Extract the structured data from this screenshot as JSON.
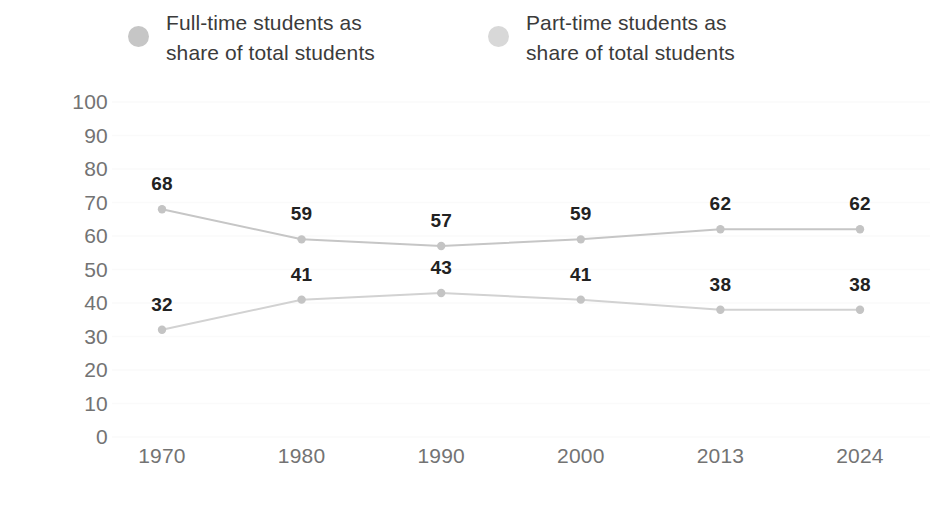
{
  "legend": {
    "items": [
      {
        "label": "Full-time students as\nshare of total students",
        "color": "#c6c6c6",
        "marker": "legend-dot-full-time"
      },
      {
        "label": "Part-time students as\nshare of total students",
        "color": "#d8d8d8",
        "marker": "legend-dot-part-time"
      }
    ]
  },
  "axis": {
    "ylabel": "Percent",
    "yticks": [
      "100",
      "90",
      "80",
      "70",
      "60",
      "50",
      "40",
      "30",
      "20",
      "10",
      "0"
    ],
    "xticks": [
      "1970",
      "1980",
      "1990",
      "2000",
      "2013",
      "2024"
    ]
  },
  "chart_data": {
    "type": "line",
    "title": "",
    "xlabel": "",
    "ylabel": "Percent",
    "ylim": [
      0,
      100
    ],
    "ytick_step": 10,
    "grid": true,
    "legend_position": "top",
    "categories": [
      "1970",
      "1980",
      "1990",
      "2000",
      "2013",
      "2024"
    ],
    "series": [
      {
        "name": "Full-time students as share of total students",
        "color": "#c6c6c6",
        "values": [
          68,
          59,
          57,
          59,
          62,
          62
        ],
        "labels": [
          "68",
          "59",
          "57",
          "59",
          "62",
          "62"
        ]
      },
      {
        "name": "Part-time students as share of total students",
        "color": "#d2d2d2",
        "values": [
          32,
          41,
          43,
          41,
          38,
          38
        ],
        "labels": [
          "32",
          "41",
          "43",
          "41",
          "38",
          "38"
        ]
      }
    ]
  }
}
